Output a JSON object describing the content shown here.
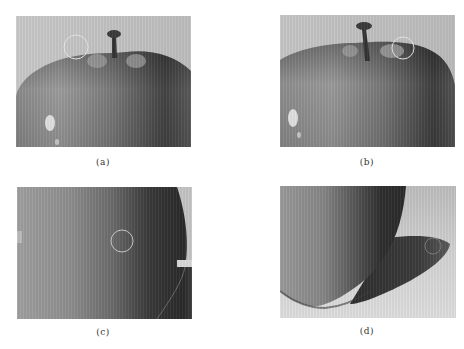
{
  "figure": {
    "panels": [
      {
        "id": "a",
        "caption": "(a)",
        "subject": "apple top with stem, highlight circle near upper-left shoulder",
        "marker_circle": {
          "cx": 60,
          "cy": 31,
          "r": 12
        }
      },
      {
        "id": "b",
        "caption": "(b)",
        "subject": "apple top with stem, highlight circle near upper-right shoulder",
        "marker_circle": {
          "cx": 123,
          "cy": 33,
          "r": 11
        }
      },
      {
        "id": "c",
        "caption": "(c)",
        "subject": "close-up of apple side, highlight circle at center-right",
        "marker_circle": {
          "cx": 105,
          "cy": 54,
          "r": 11
        }
      },
      {
        "id": "d",
        "caption": "(d)",
        "subject": "apple bottom with cast shadow, highlight circle on shadow",
        "marker_circle": {
          "cx": 153,
          "cy": 60,
          "r": 8
        }
      }
    ],
    "colors": {
      "background": "#ffffff",
      "backdrop": "#c8c8c8",
      "apple_light": "#b4b4b4",
      "apple_dark": "#2e2e2e",
      "marker": "#e6e6e6"
    }
  }
}
